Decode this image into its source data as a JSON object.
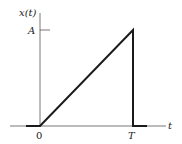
{
  "diagram": {
    "type": "signal-waveform",
    "y_axis_label": "x(t)",
    "x_axis_label": "t",
    "amplitude_label": "A",
    "origin_label": "0",
    "end_label": "T",
    "colors": {
      "line": "#1a1a1a",
      "axis": "#555555",
      "background": "#ffffff"
    }
  }
}
